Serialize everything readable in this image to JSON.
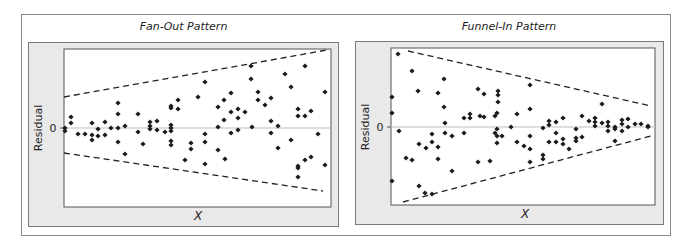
{
  "chart_data": [
    {
      "type": "scatter",
      "title": "Fan-Out Pattern",
      "xlabel": "X",
      "ylabel": "Residual",
      "ytick_labels": [
        "0"
      ],
      "grid": false,
      "reference_line": {
        "y": 0,
        "color": "#bdbdbd"
      },
      "envelope": {
        "style": "dashed",
        "upper": [
          [
            64,
            97
          ],
          [
            327,
            50
          ]
        ],
        "lower": [
          [
            64,
            153
          ],
          [
            323,
            191
          ]
        ]
      },
      "point_color": "#1a1a1a",
      "points_px": [
        [
          65,
          128
        ],
        [
          65,
          131
        ],
        [
          71,
          117
        ],
        [
          71,
          123
        ],
        [
          78,
          134
        ],
        [
          85,
          134
        ],
        [
          92,
          123
        ],
        [
          92,
          135
        ],
        [
          92,
          140
        ],
        [
          98,
          129
        ],
        [
          98,
          136
        ],
        [
          105,
          122
        ],
        [
          105,
          135
        ],
        [
          111,
          128
        ],
        [
          118,
          103
        ],
        [
          118,
          114
        ],
        [
          118,
          128
        ],
        [
          118,
          142
        ],
        [
          125,
          126
        ],
        [
          125,
          154
        ],
        [
          138,
          114
        ],
        [
          138,
          132
        ],
        [
          143,
          144
        ],
        [
          150,
          122
        ],
        [
          150,
          126
        ],
        [
          150,
          129
        ],
        [
          157,
          121
        ],
        [
          157,
          130
        ],
        [
          165,
          132
        ],
        [
          171,
          106
        ],
        [
          171,
          108
        ],
        [
          171,
          125
        ],
        [
          171,
          128
        ],
        [
          171,
          131
        ],
        [
          171,
          141
        ],
        [
          171,
          145
        ],
        [
          178,
          109
        ],
        [
          178,
          100
        ],
        [
          185,
          160
        ],
        [
          191,
          143
        ],
        [
          191,
          149
        ],
        [
          198,
          97
        ],
        [
          205,
          82
        ],
        [
          205,
          134
        ],
        [
          205,
          142
        ],
        [
          205,
          164
        ],
        [
          218,
          107
        ],
        [
          218,
          127
        ],
        [
          218,
          150
        ],
        [
          224,
          100
        ],
        [
          224,
          120
        ],
        [
          225,
          159
        ],
        [
          231,
          93
        ],
        [
          231,
          112
        ],
        [
          231,
          133
        ],
        [
          238,
          109
        ],
        [
          238,
          118
        ],
        [
          238,
          130
        ],
        [
          245,
          112
        ],
        [
          251,
          66
        ],
        [
          251,
          79
        ],
        [
          252,
          127
        ],
        [
          258,
          92
        ],
        [
          258,
          100
        ],
        [
          265,
          105
        ],
        [
          271,
          98
        ],
        [
          271,
          121
        ],
        [
          271,
          133
        ],
        [
          278,
          126
        ],
        [
          278,
          148
        ],
        [
          285,
          74
        ],
        [
          291,
          87
        ],
        [
          291,
          140
        ],
        [
          298,
          109
        ],
        [
          298,
          116
        ],
        [
          298,
          166
        ],
        [
          298,
          168
        ],
        [
          298,
          177
        ],
        [
          305,
          66
        ],
        [
          305,
          116
        ],
        [
          305,
          160
        ],
        [
          311,
          111
        ],
        [
          311,
          157
        ],
        [
          318,
          134
        ],
        [
          325,
          92
        ],
        [
          325,
          165
        ]
      ]
    },
    {
      "type": "scatter",
      "title": "Funnel-In Pattern",
      "xlabel": "X",
      "ylabel": "Residual",
      "ytick_labels": [
        "0"
      ],
      "grid": false,
      "reference_line": {
        "y": 0,
        "color": "#bdbdbd"
      },
      "envelope": {
        "style": "dashed",
        "upper": [
          [
            408,
            51
          ],
          [
            651,
            106
          ]
        ],
        "lower": [
          [
            403,
            202
          ],
          [
            651,
            136
          ]
        ]
      },
      "point_color": "#1a1a1a",
      "points_px": [
        [
          392,
          97
        ],
        [
          392,
          113
        ],
        [
          392,
          181
        ],
        [
          398,
          54
        ],
        [
          399,
          131
        ],
        [
          406,
          158
        ],
        [
          412,
          160
        ],
        [
          412,
          71
        ],
        [
          418,
          91
        ],
        [
          419,
          186
        ],
        [
          419,
          144
        ],
        [
          425,
          193
        ],
        [
          426,
          148
        ],
        [
          432,
          194
        ],
        [
          432,
          134
        ],
        [
          432,
          142
        ],
        [
          438,
          159
        ],
        [
          438,
          93
        ],
        [
          438,
          147
        ],
        [
          444,
          79
        ],
        [
          444,
          107
        ],
        [
          445,
          123
        ],
        [
          445,
          133
        ],
        [
          452,
          136
        ],
        [
          452,
          171
        ],
        [
          464,
          118
        ],
        [
          464,
          133
        ],
        [
          470,
          114
        ],
        [
          470,
          118
        ],
        [
          478,
          89
        ],
        [
          478,
          162
        ],
        [
          480,
          116
        ],
        [
          484,
          94
        ],
        [
          484,
          117
        ],
        [
          490,
          161
        ],
        [
          495,
          116
        ],
        [
          495,
          133
        ],
        [
          498,
          91
        ],
        [
          498,
          95
        ],
        [
          498,
          102
        ],
        [
          497,
          113
        ],
        [
          497,
          129
        ],
        [
          497,
          136
        ],
        [
          497,
          143
        ],
        [
          502,
          136
        ],
        [
          511,
          127
        ],
        [
          517,
          114
        ],
        [
          517,
          142
        ],
        [
          524,
          146
        ],
        [
          530,
          85
        ],
        [
          530,
          109
        ],
        [
          530,
          136
        ],
        [
          530,
          149
        ],
        [
          530,
          162
        ],
        [
          543,
          128
        ],
        [
          543,
          155
        ],
        [
          543,
          159
        ],
        [
          549,
          121
        ],
        [
          549,
          125
        ],
        [
          549,
          142
        ],
        [
          556,
          122
        ],
        [
          556,
          133
        ],
        [
          556,
          142
        ],
        [
          563,
          118
        ],
        [
          563,
          139
        ],
        [
          563,
          144
        ],
        [
          569,
          149
        ],
        [
          576,
          129
        ],
        [
          576,
          138
        ],
        [
          576,
          141
        ],
        [
          582,
          116
        ],
        [
          582,
          137
        ],
        [
          589,
          121
        ],
        [
          595,
          118
        ],
        [
          595,
          122
        ],
        [
          595,
          126
        ],
        [
          602,
          104
        ],
        [
          602,
          123
        ],
        [
          608,
          122
        ],
        [
          608,
          126
        ],
        [
          608,
          131
        ],
        [
          615,
          127
        ],
        [
          615,
          129
        ],
        [
          615,
          141
        ],
        [
          622,
          120
        ],
        [
          622,
          124
        ],
        [
          622,
          131
        ],
        [
          628,
          119
        ],
        [
          628,
          127
        ],
        [
          635,
          124
        ],
        [
          641,
          124
        ],
        [
          648,
          126
        ],
        [
          648,
          127
        ]
      ]
    }
  ],
  "panels": {
    "left": {
      "title": "Fan-Out Pattern",
      "ylabel": "Residual",
      "xlabel": "X",
      "zero_tick": "0"
    },
    "right": {
      "title": "Funnel-In Pattern",
      "ylabel": "Residual",
      "xlabel": "X",
      "zero_tick": "0"
    }
  }
}
